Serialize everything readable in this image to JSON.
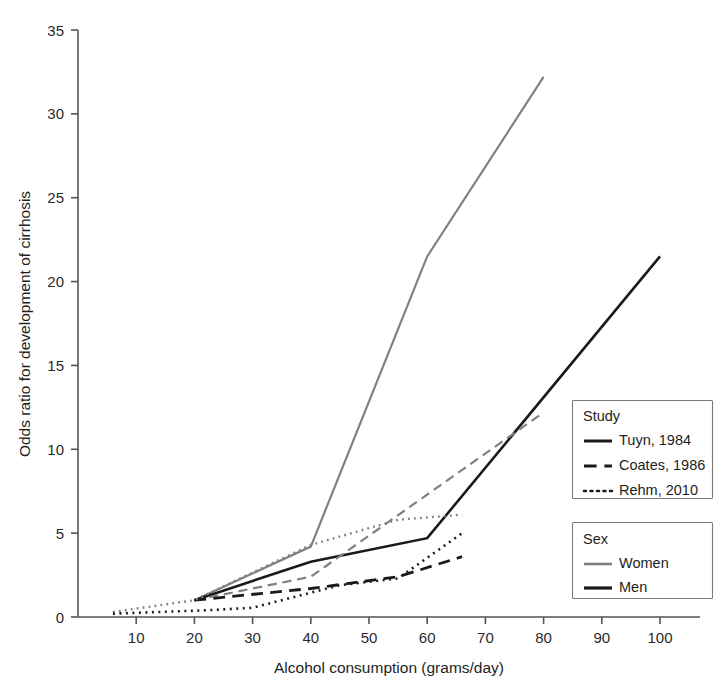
{
  "chart_data": {
    "type": "line",
    "title": "",
    "xlabel": "Alcohol consumption (grams/day)",
    "ylabel": "Odds ratio for development of cirrhosis",
    "xlim": [
      0,
      106
    ],
    "ylim": [
      0,
      35
    ],
    "xticks": [
      10,
      20,
      30,
      40,
      50,
      60,
      70,
      80,
      90,
      100
    ],
    "yticks": [
      0,
      5,
      10,
      15,
      20,
      25,
      30,
      35
    ],
    "grid": false,
    "legend_position": "right",
    "series": [
      {
        "name": "Tuyn, 1984 — Women",
        "study": "Tuyn, 1984",
        "sex": "Women",
        "style": "solid",
        "color": "#808080",
        "width": 2.2,
        "points": [
          [
            20,
            1.0
          ],
          [
            40,
            4.2
          ],
          [
            60,
            21.5
          ],
          [
            80,
            32.2
          ]
        ]
      },
      {
        "name": "Tuyn, 1984 — Men",
        "study": "Tuyn, 1984",
        "sex": "Men",
        "style": "solid",
        "color": "#1a1a1a",
        "width": 2.6,
        "points": [
          [
            20,
            1.0
          ],
          [
            40,
            3.3
          ],
          [
            60,
            4.7
          ],
          [
            100,
            21.5
          ]
        ]
      },
      {
        "name": "Coates, 1986 — Women",
        "study": "Coates, 1986",
        "sex": "Women",
        "style": "dashed",
        "color": "#808080",
        "width": 2.2,
        "points": [
          [
            20,
            1.0
          ],
          [
            40,
            2.4
          ],
          [
            80,
            12.2
          ]
        ]
      },
      {
        "name": "Coates, 1986 — Men",
        "study": "Coates, 1986",
        "sex": "Men",
        "style": "dashed",
        "color": "#1a1a1a",
        "width": 2.8,
        "points": [
          [
            20,
            1.0
          ],
          [
            40,
            1.7
          ],
          [
            55,
            2.4
          ],
          [
            66,
            3.6
          ]
        ]
      },
      {
        "name": "Rehm, 2010 — Women",
        "study": "Rehm, 2010",
        "sex": "Women",
        "style": "dotted",
        "color": "#808080",
        "width": 2.4,
        "points": [
          [
            6,
            0.3
          ],
          [
            20,
            1.0
          ],
          [
            40,
            4.3
          ],
          [
            55,
            5.8
          ],
          [
            66,
            6.1
          ]
        ]
      },
      {
        "name": "Rehm, 2010 — Men",
        "study": "Rehm, 2010",
        "sex": "Men",
        "style": "dotted",
        "color": "#1a1a1a",
        "width": 2.6,
        "points": [
          [
            6,
            0.2
          ],
          [
            22,
            0.4
          ],
          [
            30,
            0.55
          ],
          [
            45,
            1.9
          ],
          [
            55,
            2.3
          ],
          [
            66,
            5.0
          ]
        ]
      }
    ]
  },
  "axes": {
    "x_title": "Alcohol consumption (grams/day)",
    "y_title": "Odds ratio for development of cirrhosis",
    "x_tick_labels": [
      "10",
      "20",
      "30",
      "40",
      "50",
      "60",
      "70",
      "80",
      "90",
      "100"
    ],
    "y_tick_labels": [
      "0",
      "5",
      "10",
      "15",
      "20",
      "25",
      "30",
      "35"
    ]
  },
  "legend": {
    "study": {
      "title": "Study",
      "entries": [
        {
          "label": "Tuyn, 1984",
          "style": "solid"
        },
        {
          "label": "Coates, 1986",
          "style": "dashed"
        },
        {
          "label": "Rehm, 2010",
          "style": "dotted"
        }
      ]
    },
    "sex": {
      "title": "Sex",
      "entries": [
        {
          "label": "Women",
          "color": "#808080"
        },
        {
          "label": "Men",
          "color": "#1a1a1a"
        }
      ]
    }
  },
  "colors": {
    "women": "#808080",
    "men": "#1a1a1a",
    "axis": "#555555",
    "text": "#1e1e1e",
    "background": "#ffffff"
  }
}
